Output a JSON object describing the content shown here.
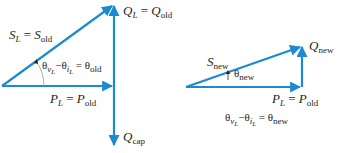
{
  "diagram": {
    "colors": {
      "vector": "#1b8ad3",
      "text": "#231f20",
      "arc": "#9a9a9a"
    },
    "left_triangle": {
      "S": {
        "sym": "S",
        "sub": "L",
        "eq": "=",
        "rhs": "S",
        "rhs_sub": "old"
      },
      "Q": {
        "sym": "Q",
        "sub": "L",
        "eq": "=",
        "rhs": "Q",
        "rhs_sub": "old"
      },
      "P": {
        "sym": "P",
        "sub": "L",
        "eq": "=",
        "rhs": "P",
        "rhs_sub": "old"
      },
      "Qcap": {
        "sym": "Q",
        "sub": "cap"
      },
      "angle": {
        "a": "θ",
        "a_sub": "v",
        "a_subsub": "L",
        "minus": "−",
        "b": "θ",
        "b_sub": "i",
        "b_subsub": "L",
        "eq": "=",
        "rhs": "θ",
        "rhs_sub": "old"
      }
    },
    "right_triangle": {
      "S": {
        "sym": "S",
        "sub": "new"
      },
      "Q": {
        "sym": "Q",
        "sub": "new"
      },
      "P": {
        "sym": "P",
        "sub": "L",
        "eq": "=",
        "rhs": "P",
        "rhs_sub": "old"
      },
      "theta": {
        "sym": "θ",
        "sub": "new"
      },
      "angle": {
        "a": "θ",
        "a_sub": "v",
        "a_subsub": "L",
        "minus": "−",
        "b": "θ",
        "b_sub": "i",
        "b_subsub": "L",
        "eq": "=",
        "rhs": "θ",
        "rhs_sub": "new"
      }
    }
  }
}
